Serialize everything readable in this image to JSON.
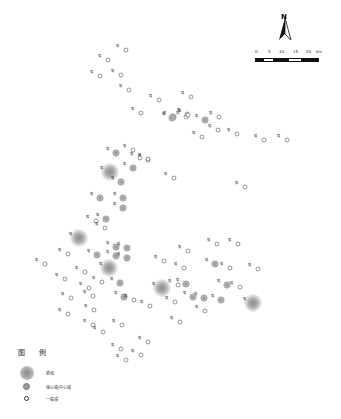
{
  "north_arrow": {
    "label": "N"
  },
  "scale_bar": {
    "ticks": [
      "0",
      "5",
      "10",
      "15",
      "20"
    ],
    "unit": "km"
  },
  "legend": {
    "title": "图 例",
    "items": [
      {
        "type": "new_city",
        "label": "新城"
      },
      {
        "type": "core_town",
        "label": "核心镇/中心镇"
      },
      {
        "type": "general_town",
        "label": "一般镇"
      }
    ]
  },
  "places": [
    {
      "type": "general_town",
      "x": 126,
      "y": 50,
      "label": "镇"
    },
    {
      "type": "general_town",
      "x": 108,
      "y": 60,
      "label": "镇"
    },
    {
      "type": "general_town",
      "x": 100,
      "y": 76,
      "label": "镇"
    },
    {
      "type": "general_town",
      "x": 121,
      "y": 75,
      "label": "镇"
    },
    {
      "type": "general_town",
      "x": 129,
      "y": 90,
      "label": "镇"
    },
    {
      "type": "general_town",
      "x": 159,
      "y": 100,
      "label": "镇"
    },
    {
      "type": "general_town",
      "x": 191,
      "y": 97,
      "label": "镇"
    },
    {
      "type": "general_town",
      "x": 141,
      "y": 113,
      "label": "镇"
    },
    {
      "type": "general_town",
      "x": 186,
      "y": 117,
      "label": "镇"
    },
    {
      "type": "core_town",
      "x": 173,
      "y": 117,
      "label": "镇"
    },
    {
      "type": "general_town",
      "x": 187,
      "y": 114,
      "label": "镇"
    },
    {
      "type": "core_town",
      "x": 172,
      "y": 118,
      "label": "镇"
    },
    {
      "type": "core_town",
      "x": 205,
      "y": 120,
      "label": "镇"
    },
    {
      "type": "general_town",
      "x": 188,
      "y": 115,
      "label": "镇"
    },
    {
      "type": "general_town",
      "x": 202,
      "y": 137,
      "label": "镇"
    },
    {
      "type": "general_town",
      "x": 219,
      "y": 117,
      "label": "镇"
    },
    {
      "type": "general_town",
      "x": 218,
      "y": 130,
      "label": "镇"
    },
    {
      "type": "general_town",
      "x": 237,
      "y": 134,
      "label": "镇"
    },
    {
      "type": "general_town",
      "x": 264,
      "y": 140,
      "label": "镇"
    },
    {
      "type": "general_town",
      "x": 287,
      "y": 140,
      "label": "镇"
    },
    {
      "type": "general_town",
      "x": 148,
      "y": 160,
      "label": "镇"
    },
    {
      "type": "general_town",
      "x": 174,
      "y": 178,
      "label": "镇"
    },
    {
      "type": "general_town",
      "x": 245,
      "y": 187,
      "label": "镇"
    },
    {
      "type": "general_town",
      "x": 133,
      "y": 150,
      "label": "镇"
    },
    {
      "type": "general_town",
      "x": 148,
      "y": 159,
      "label": "镇"
    },
    {
      "type": "core_town",
      "x": 116,
      "y": 153,
      "label": "镇"
    },
    {
      "type": "general_town",
      "x": 140,
      "y": 158,
      "label": "镇"
    },
    {
      "type": "new_city",
      "x": 110,
      "y": 172,
      "label": "镇"
    },
    {
      "type": "core_town",
      "x": 133,
      "y": 168,
      "label": "镇"
    },
    {
      "type": "core_town",
      "x": 121,
      "y": 182,
      "label": "镇"
    },
    {
      "type": "core_town",
      "x": 100,
      "y": 198,
      "label": "镇"
    },
    {
      "type": "core_town",
      "x": 123,
      "y": 198,
      "label": "镇"
    },
    {
      "type": "core_town",
      "x": 123,
      "y": 208,
      "label": "镇"
    },
    {
      "type": "general_town",
      "x": 96,
      "y": 221,
      "label": "镇"
    },
    {
      "type": "core_town",
      "x": 106,
      "y": 219,
      "label": "镇"
    },
    {
      "type": "new_city",
      "x": 79,
      "y": 238,
      "label": "镇"
    },
    {
      "type": "general_town",
      "x": 105,
      "y": 228,
      "label": "镇"
    },
    {
      "type": "core_town",
      "x": 116,
      "y": 247,
      "label": "镇"
    },
    {
      "type": "core_town",
      "x": 127,
      "y": 248,
      "label": "镇"
    },
    {
      "type": "core_town",
      "x": 97,
      "y": 255,
      "label": "镇"
    },
    {
      "type": "core_town",
      "x": 116,
      "y": 256,
      "label": "镇"
    },
    {
      "type": "core_town",
      "x": 127,
      "y": 258,
      "label": "镇"
    },
    {
      "type": "new_city",
      "x": 109,
      "y": 268,
      "label": "镇"
    },
    {
      "type": "core_town",
      "x": 120,
      "y": 283,
      "label": "镇"
    },
    {
      "type": "general_town",
      "x": 68,
      "y": 254,
      "label": "镇"
    },
    {
      "type": "general_town",
      "x": 45,
      "y": 264,
      "label": "镇"
    },
    {
      "type": "general_town",
      "x": 85,
      "y": 272,
      "label": "镇"
    },
    {
      "type": "general_town",
      "x": 102,
      "y": 282,
      "label": "镇"
    },
    {
      "type": "general_town",
      "x": 65,
      "y": 279,
      "label": "镇"
    },
    {
      "type": "general_town",
      "x": 89,
      "y": 288,
      "label": "镇"
    },
    {
      "type": "general_town",
      "x": 71,
      "y": 298,
      "label": "镇"
    },
    {
      "type": "general_town",
      "x": 93,
      "y": 296,
      "label": "镇"
    },
    {
      "type": "general_town",
      "x": 68,
      "y": 314,
      "label": "镇"
    },
    {
      "type": "general_town",
      "x": 94,
      "y": 310,
      "label": "镇"
    },
    {
      "type": "general_town",
      "x": 93,
      "y": 325,
      "label": "镇"
    },
    {
      "type": "core_town",
      "x": 124,
      "y": 297,
      "label": "镇"
    },
    {
      "type": "general_town",
      "x": 134,
      "y": 300,
      "label": "镇"
    },
    {
      "type": "general_town",
      "x": 103,
      "y": 332,
      "label": "镇"
    },
    {
      "type": "general_town",
      "x": 122,
      "y": 325,
      "label": "镇"
    },
    {
      "type": "general_town",
      "x": 121,
      "y": 349,
      "label": "镇"
    },
    {
      "type": "general_town",
      "x": 126,
      "y": 360,
      "label": "镇"
    },
    {
      "type": "general_town",
      "x": 148,
      "y": 342,
      "label": "镇"
    },
    {
      "type": "general_town",
      "x": 141,
      "y": 355,
      "label": "镇"
    },
    {
      "type": "general_town",
      "x": 150,
      "y": 306,
      "label": "镇"
    },
    {
      "type": "general_town",
      "x": 175,
      "y": 302,
      "label": "镇"
    },
    {
      "type": "general_town",
      "x": 188,
      "y": 251,
      "label": "镇"
    },
    {
      "type": "general_town",
      "x": 164,
      "y": 261,
      "label": "镇"
    },
    {
      "type": "core_town",
      "x": 215,
      "y": 264,
      "label": "镇"
    },
    {
      "type": "general_town",
      "x": 230,
      "y": 268,
      "label": "镇"
    },
    {
      "type": "general_town",
      "x": 217,
      "y": 244,
      "label": "镇"
    },
    {
      "type": "general_town",
      "x": 238,
      "y": 244,
      "label": "镇"
    },
    {
      "type": "general_town",
      "x": 258,
      "y": 269,
      "label": "镇"
    },
    {
      "type": "general_town",
      "x": 184,
      "y": 268,
      "label": "镇"
    },
    {
      "type": "new_city",
      "x": 162,
      "y": 288,
      "label": "镇"
    },
    {
      "type": "core_town",
      "x": 186,
      "y": 284,
      "label": "镇"
    },
    {
      "type": "core_town",
      "x": 227,
      "y": 285,
      "label": "镇"
    },
    {
      "type": "general_town",
      "x": 240,
      "y": 287,
      "label": "镇"
    },
    {
      "type": "core_town",
      "x": 204,
      "y": 298,
      "label": "镇"
    },
    {
      "type": "core_town",
      "x": 221,
      "y": 300,
      "label": "镇"
    },
    {
      "type": "core_town",
      "x": 193,
      "y": 297,
      "label": "镇"
    },
    {
      "type": "general_town",
      "x": 178,
      "y": 285,
      "label": "镇"
    },
    {
      "type": "general_town",
      "x": 205,
      "y": 311,
      "label": "镇"
    },
    {
      "type": "general_town",
      "x": 180,
      "y": 322,
      "label": "镇"
    },
    {
      "type": "new_city",
      "x": 253,
      "y": 303,
      "label": "镇"
    }
  ]
}
